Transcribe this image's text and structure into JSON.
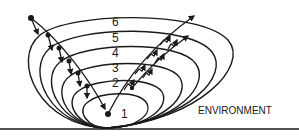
{
  "diagram": {
    "type": "nested-ellipses",
    "levels": [
      {
        "label": "1",
        "left": 80,
        "right": 150,
        "top": 91
      },
      {
        "label": "2",
        "left": 68,
        "right": 164,
        "top": 77
      },
      {
        "label": "3",
        "left": 55,
        "right": 180,
        "top": 62
      },
      {
        "label": "4",
        "left": 43,
        "right": 196,
        "top": 47
      },
      {
        "label": "5",
        "left": 29,
        "right": 213,
        "top": 32
      },
      {
        "label": "6",
        "left": 15,
        "right": 232,
        "top": 17
      }
    ],
    "bottom_y": 128,
    "center_dot": {
      "x": 108,
      "y": 114
    },
    "environment_label": "ENVIRONMENT",
    "colors": {
      "ink": "#1a1a1a",
      "background": "#ffffff"
    }
  }
}
